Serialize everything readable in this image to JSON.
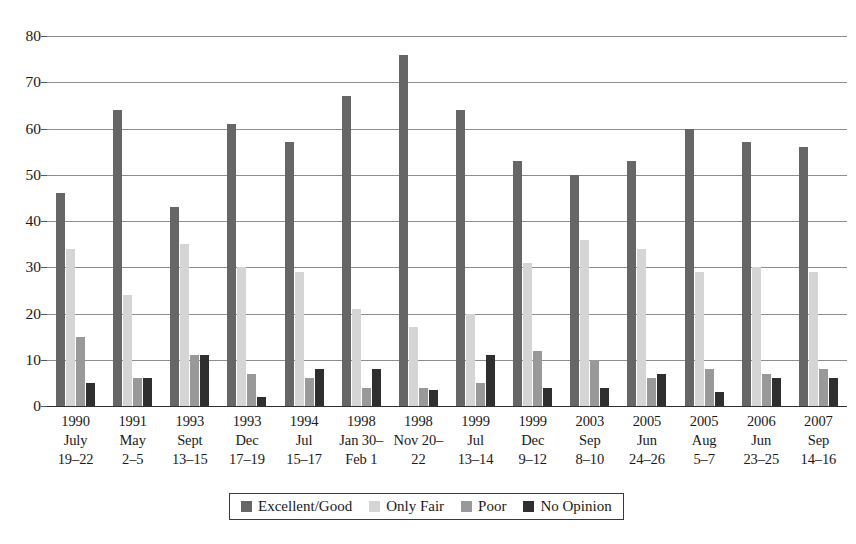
{
  "chart_data": {
    "type": "bar",
    "title": "",
    "subtitle": "",
    "xlabel": "",
    "ylabel": "",
    "ylim": [
      0,
      80
    ],
    "yticks": [
      0,
      10,
      20,
      30,
      40,
      50,
      60,
      70,
      80
    ],
    "grid": true,
    "legend_position": "bottom",
    "categories": [
      "1990 July 19–22",
      "1991 May 2–5",
      "1993 Sept 13–15",
      "1993 Dec 17–19",
      "1994 Jul 15–17",
      "1998 Jan 30–Feb 1",
      "1998 Nov 20–22",
      "1999 Jul 13–14",
      "1999 Dec 9–12",
      "2003 Sep 8–10",
      "2005 Jun 24–26",
      "2005 Aug 5–7",
      "2006 Jun 23–25",
      "2007 Sep 14–16"
    ],
    "category_lines": [
      [
        "1990",
        "July",
        "19–22"
      ],
      [
        "1991",
        "May",
        "2–5"
      ],
      [
        "1993",
        "Sept",
        "13–15"
      ],
      [
        "1993",
        "Dec",
        "17–19"
      ],
      [
        "1994",
        "Jul",
        "15–17"
      ],
      [
        "1998",
        "Jan 30–",
        "Feb 1"
      ],
      [
        "1998",
        "Nov 20–",
        "22"
      ],
      [
        "1999",
        "Jul",
        "13–14"
      ],
      [
        "1999",
        "Dec",
        "9–12"
      ],
      [
        "2003",
        "Sep",
        "8–10"
      ],
      [
        "2005",
        "Jun",
        "24–26"
      ],
      [
        "2005",
        "Aug",
        "5–7"
      ],
      [
        "2006",
        "Jun",
        "23–25"
      ],
      [
        "2007",
        "Sep",
        "14–16"
      ]
    ],
    "series": [
      {
        "name": "Excellent/Good",
        "color": "#666666",
        "values": [
          46,
          64,
          43,
          61,
          57,
          67,
          76,
          64,
          53,
          50,
          53,
          60,
          57,
          56
        ]
      },
      {
        "name": "Only Fair",
        "color": "#d5d5d5",
        "values": [
          34,
          24,
          35,
          30,
          29,
          21,
          17,
          20,
          31,
          36,
          34,
          29,
          30,
          29
        ]
      },
      {
        "name": "Poor",
        "color": "#999999",
        "values": [
          15,
          6,
          11,
          7,
          6,
          4,
          4,
          5,
          12,
          10,
          6,
          8,
          7,
          8
        ]
      },
      {
        "name": "No Opinion",
        "color": "#2f2f2f",
        "values": [
          5,
          6,
          11,
          2,
          8,
          8,
          3.5,
          11,
          4,
          4,
          7,
          3,
          6,
          6
        ]
      }
    ]
  }
}
